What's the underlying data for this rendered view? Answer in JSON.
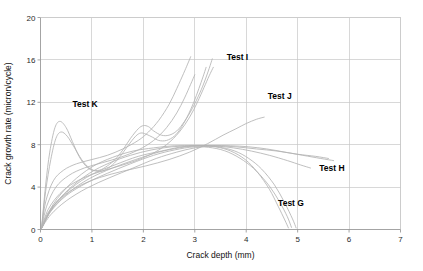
{
  "chart_data": {
    "type": "line",
    "title": "",
    "xlabel": "Crack depth (mm)",
    "ylabel": "Crack growth rate (micron/cycle)",
    "xlim": [
      0,
      7
    ],
    "ylim": [
      0,
      20
    ],
    "xticks": [
      0,
      1,
      2,
      3,
      4,
      5,
      6,
      7
    ],
    "yticks": [
      0,
      4,
      8,
      12,
      16,
      20
    ],
    "xtick_labels": [
      "0",
      "1",
      "2",
      "3",
      "4",
      "5",
      "6",
      "7"
    ],
    "ytick_labels": [
      "0",
      "4",
      "8",
      "12",
      "16",
      "20"
    ],
    "grid": true,
    "legend": "annotations-inline",
    "series_color": "#b4b4b4",
    "annotations": [
      {
        "label": "Test K",
        "x": 0.62,
        "y": 11.6
      },
      {
        "label": "Test I",
        "x": 3.62,
        "y": 16.0
      },
      {
        "label": "Test J",
        "x": 4.42,
        "y": 12.3
      },
      {
        "label": "Test H",
        "x": 5.42,
        "y": 5.5
      },
      {
        "label": "Test G",
        "x": 4.62,
        "y": 2.2
      }
    ],
    "series": [
      {
        "name": "Test K",
        "points": [
          [
            0.02,
            0.1
          ],
          [
            0.1,
            4.2
          ],
          [
            0.18,
            7.3
          ],
          [
            0.28,
            9.6
          ],
          [
            0.38,
            10.2
          ],
          [
            0.5,
            9.6
          ],
          [
            0.62,
            8.3
          ],
          [
            0.75,
            6.9
          ],
          [
            0.88,
            6.0
          ],
          [
            1.0,
            5.6
          ],
          [
            1.15,
            5.6
          ],
          [
            1.3,
            6.0
          ],
          [
            1.45,
            6.6
          ],
          [
            1.6,
            7.5
          ],
          [
            1.75,
            8.6
          ],
          [
            1.9,
            9.5
          ],
          [
            2.0,
            9.8
          ],
          [
            2.1,
            9.7
          ],
          [
            2.2,
            9.3
          ],
          [
            2.35,
            8.9
          ],
          [
            2.5,
            8.9
          ],
          [
            2.65,
            9.3
          ],
          [
            2.8,
            10.2
          ],
          [
            2.95,
            11.4
          ],
          [
            3.1,
            12.9
          ],
          [
            3.2,
            14.1
          ],
          [
            3.28,
            15.2
          ],
          [
            3.34,
            16.1
          ]
        ]
      },
      {
        "name": "Test K2",
        "points": [
          [
            0.02,
            0.1
          ],
          [
            0.1,
            3.6
          ],
          [
            0.2,
            6.6
          ],
          [
            0.3,
            8.6
          ],
          [
            0.4,
            9.2
          ],
          [
            0.52,
            8.8
          ],
          [
            0.65,
            7.8
          ],
          [
            0.8,
            6.6
          ],
          [
            0.95,
            5.8
          ],
          [
            1.1,
            5.5
          ],
          [
            1.25,
            5.6
          ],
          [
            1.4,
            6.1
          ],
          [
            1.55,
            6.9
          ],
          [
            1.7,
            7.9
          ],
          [
            1.85,
            8.8
          ],
          [
            1.95,
            9.1
          ],
          [
            2.05,
            9.0
          ],
          [
            2.18,
            8.7
          ],
          [
            2.3,
            8.4
          ],
          [
            2.45,
            8.4
          ],
          [
            2.6,
            8.8
          ],
          [
            2.72,
            9.5
          ],
          [
            2.85,
            10.6
          ],
          [
            2.98,
            12.0
          ],
          [
            3.08,
            13.3
          ],
          [
            3.16,
            14.4
          ],
          [
            3.22,
            15.3
          ]
        ]
      },
      {
        "name": "Test I",
        "points": [
          [
            0.02,
            0.1
          ],
          [
            0.1,
            2.6
          ],
          [
            0.25,
            4.6
          ],
          [
            0.45,
            5.6
          ],
          [
            0.7,
            6.2
          ],
          [
            1.0,
            6.6
          ],
          [
            1.3,
            7.0
          ],
          [
            1.6,
            7.6
          ],
          [
            1.9,
            8.4
          ],
          [
            2.1,
            9.2
          ],
          [
            2.3,
            10.3
          ],
          [
            2.5,
            11.8
          ],
          [
            2.65,
            13.3
          ],
          [
            2.78,
            14.7
          ],
          [
            2.86,
            15.6
          ],
          [
            2.92,
            16.3
          ]
        ]
      },
      {
        "name": "Test I2",
        "points": [
          [
            0.02,
            0.1
          ],
          [
            0.12,
            2.2
          ],
          [
            0.3,
            4.0
          ],
          [
            0.55,
            5.1
          ],
          [
            0.85,
            5.8
          ],
          [
            1.2,
            6.3
          ],
          [
            1.55,
            6.8
          ],
          [
            1.9,
            7.5
          ],
          [
            2.2,
            8.4
          ],
          [
            2.45,
            9.6
          ],
          [
            2.65,
            11.0
          ],
          [
            2.8,
            12.4
          ],
          [
            2.92,
            13.7
          ],
          [
            3.0,
            14.6
          ]
        ]
      },
      {
        "name": "Test I3",
        "points": [
          [
            0.02,
            0.1
          ],
          [
            0.15,
            1.9
          ],
          [
            0.38,
            3.4
          ],
          [
            0.65,
            4.4
          ],
          [
            1.0,
            5.2
          ],
          [
            1.4,
            5.8
          ],
          [
            1.8,
            6.4
          ],
          [
            2.15,
            7.1
          ],
          [
            2.45,
            8.0
          ],
          [
            2.7,
            9.2
          ],
          [
            2.9,
            10.6
          ],
          [
            3.05,
            12.0
          ],
          [
            3.18,
            13.4
          ],
          [
            3.28,
            14.5
          ],
          [
            3.36,
            15.3
          ]
        ]
      },
      {
        "name": "Test J",
        "points": [
          [
            0.02,
            0.1
          ],
          [
            0.15,
            1.6
          ],
          [
            0.4,
            3.0
          ],
          [
            0.75,
            4.1
          ],
          [
            1.15,
            4.9
          ],
          [
            1.6,
            5.5
          ],
          [
            2.05,
            6.0
          ],
          [
            2.5,
            6.6
          ],
          [
            2.9,
            7.3
          ],
          [
            3.25,
            8.1
          ],
          [
            3.55,
            8.9
          ],
          [
            3.8,
            9.5
          ],
          [
            4.0,
            10.0
          ],
          [
            4.2,
            10.4
          ],
          [
            4.35,
            10.6
          ]
        ]
      },
      {
        "name": "Test H",
        "points": [
          [
            0.02,
            0.1
          ],
          [
            0.2,
            1.4
          ],
          [
            0.5,
            2.7
          ],
          [
            0.9,
            3.9
          ],
          [
            1.35,
            4.9
          ],
          [
            1.8,
            5.8
          ],
          [
            2.25,
            6.7
          ],
          [
            2.65,
            7.3
          ],
          [
            3.0,
            7.7
          ],
          [
            3.35,
            7.9
          ],
          [
            3.7,
            7.9
          ],
          [
            4.05,
            7.8
          ],
          [
            4.4,
            7.6
          ],
          [
            4.75,
            7.3
          ],
          [
            5.1,
            7.0
          ],
          [
            5.45,
            6.7
          ],
          [
            5.7,
            6.5
          ]
        ]
      },
      {
        "name": "Test H2",
        "points": [
          [
            0.02,
            0.1
          ],
          [
            0.25,
            2.4
          ],
          [
            0.6,
            4.4
          ],
          [
            1.0,
            5.9
          ],
          [
            1.4,
            6.8
          ],
          [
            1.8,
            7.4
          ],
          [
            2.2,
            7.7
          ],
          [
            2.6,
            7.9
          ],
          [
            3.0,
            7.9
          ],
          [
            3.4,
            7.9
          ],
          [
            3.8,
            7.8
          ],
          [
            4.2,
            7.6
          ],
          [
            4.6,
            7.4
          ],
          [
            5.0,
            7.1
          ],
          [
            5.35,
            6.9
          ],
          [
            5.6,
            6.7
          ]
        ]
      },
      {
        "name": "Test H3",
        "points": [
          [
            0.02,
            0.1
          ],
          [
            0.22,
            2.0
          ],
          [
            0.55,
            3.8
          ],
          [
            0.95,
            5.3
          ],
          [
            1.35,
            6.3
          ],
          [
            1.75,
            7.0
          ],
          [
            2.15,
            7.5
          ],
          [
            2.55,
            7.8
          ],
          [
            2.95,
            7.9
          ],
          [
            3.35,
            7.9
          ],
          [
            3.75,
            7.7
          ],
          [
            4.1,
            7.4
          ],
          [
            4.45,
            7.0
          ],
          [
            4.8,
            6.5
          ],
          [
            5.05,
            6.1
          ],
          [
            5.25,
            5.8
          ]
        ]
      },
      {
        "name": "Test G",
        "points": [
          [
            0.02,
            0.1
          ],
          [
            0.2,
            1.7
          ],
          [
            0.5,
            3.2
          ],
          [
            0.9,
            4.4
          ],
          [
            1.3,
            5.3
          ],
          [
            1.75,
            6.2
          ],
          [
            2.2,
            7.0
          ],
          [
            2.6,
            7.5
          ],
          [
            3.0,
            7.8
          ],
          [
            3.35,
            7.7
          ],
          [
            3.65,
            7.3
          ],
          [
            3.95,
            6.5
          ],
          [
            4.2,
            5.5
          ],
          [
            4.45,
            4.1
          ],
          [
            4.65,
            2.6
          ],
          [
            4.8,
            1.2
          ],
          [
            4.88,
            0.2
          ]
        ]
      },
      {
        "name": "Test G2",
        "points": [
          [
            0.02,
            0.1
          ],
          [
            0.22,
            1.9
          ],
          [
            0.55,
            3.5
          ],
          [
            0.95,
            4.8
          ],
          [
            1.4,
            5.8
          ],
          [
            1.85,
            6.6
          ],
          [
            2.3,
            7.3
          ],
          [
            2.7,
            7.7
          ],
          [
            3.05,
            7.9
          ],
          [
            3.4,
            7.8
          ],
          [
            3.7,
            7.4
          ],
          [
            3.98,
            6.6
          ],
          [
            4.22,
            5.4
          ],
          [
            4.45,
            3.8
          ],
          [
            4.62,
            2.2
          ],
          [
            4.75,
            0.9
          ],
          [
            4.82,
            0.15
          ]
        ]
      },
      {
        "name": "Test G3",
        "points": [
          [
            0.02,
            0.1
          ],
          [
            0.25,
            2.2
          ],
          [
            0.6,
            3.9
          ],
          [
            1.0,
            5.2
          ],
          [
            1.45,
            6.1
          ],
          [
            1.9,
            6.9
          ],
          [
            2.35,
            7.4
          ],
          [
            2.75,
            7.8
          ],
          [
            3.1,
            7.9
          ],
          [
            3.45,
            7.8
          ],
          [
            3.78,
            7.4
          ],
          [
            4.05,
            6.7
          ],
          [
            4.3,
            5.7
          ],
          [
            4.55,
            4.2
          ],
          [
            4.75,
            2.5
          ],
          [
            4.9,
            1.0
          ],
          [
            4.97,
            0.15
          ]
        ]
      }
    ]
  }
}
